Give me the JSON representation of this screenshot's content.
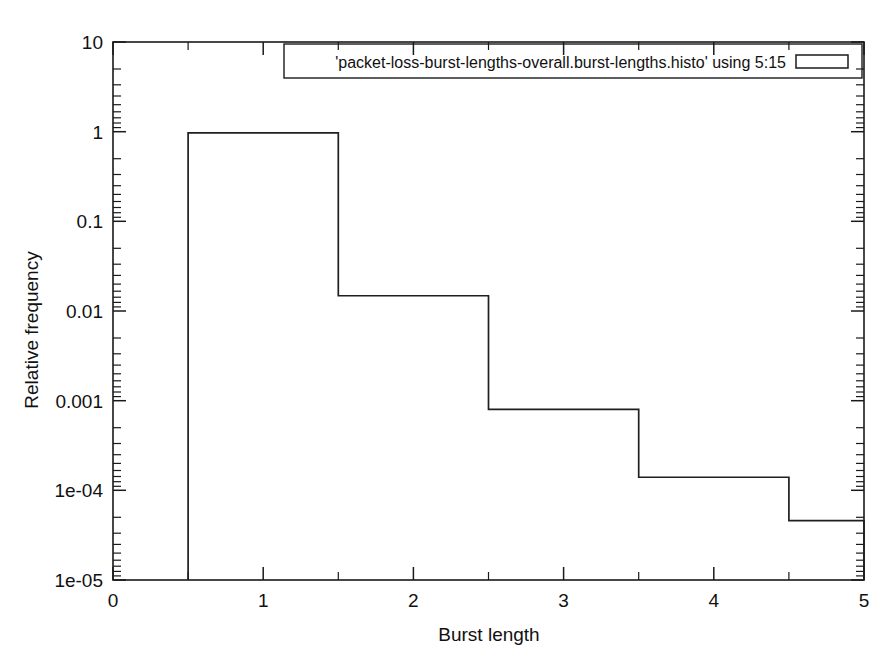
{
  "chart_data": {
    "type": "bar",
    "title": "",
    "subtitle": "",
    "xlabel": "Burst length",
    "ylabel": "Relative frequency",
    "legend": [
      "'packet-loss-burst-lengths-overall.burst-lengths.histo' using 5:15"
    ],
    "legend_position": "top-right inside plot",
    "grid": false,
    "yscale": "log",
    "xscale": "linear",
    "xlim": [
      0,
      5
    ],
    "ylim": [
      1e-05,
      10
    ],
    "xticks": [
      "0",
      "1",
      "2",
      "3",
      "4",
      "5"
    ],
    "xtick_values": [
      0,
      1,
      2,
      3,
      4,
      5
    ],
    "yticks": [
      "1e-05",
      "1e-04",
      "0.001",
      "0.01",
      "0.1",
      "1",
      "10"
    ],
    "ytick_values": [
      1e-05,
      0.0001,
      0.001,
      0.01,
      0.1,
      1,
      10
    ],
    "minor_ticks": true,
    "bar_width": 1,
    "categories": [
      "1",
      "2",
      "3",
      "4",
      "5"
    ],
    "x": [
      1,
      2,
      3,
      4,
      5
    ],
    "bin_edges": [
      0.5,
      1.5,
      2.5,
      3.5,
      4.5,
      5.0
    ],
    "values": [
      0.97,
      0.0148,
      0.0008,
      0.00014,
      4.6e-05
    ],
    "series": [
      {
        "name": "'packet-loss-burst-lengths-overall.burst-lengths.histo' using 5:15",
        "values": [
          0.97,
          0.0148,
          0.0008,
          0.00014,
          4.6e-05
        ]
      }
    ],
    "annotations": []
  },
  "colors": {
    "background": "#ffffff",
    "line": "#1f1f1f",
    "text": "#111111",
    "axis": "#1a1a1a"
  }
}
